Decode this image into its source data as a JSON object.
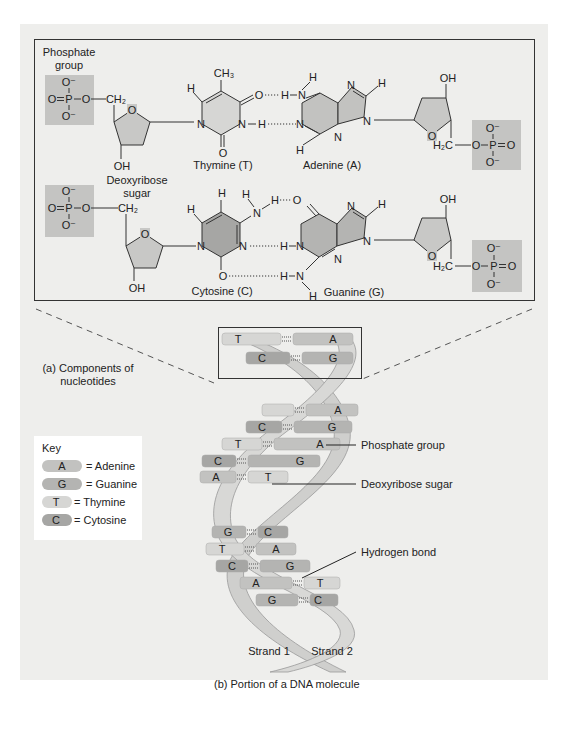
{
  "panel_a": {
    "caption": "(a) Components of nucleotides",
    "caption_line1": "(a) Components of",
    "caption_line2": "nucleotides",
    "labels": {
      "phosphate_group_line1": "Phosphate",
      "phosphate_group_line2": "group",
      "deoxyribose_line1": "Deoxyribose",
      "deoxyribose_line2": "sugar",
      "thymine": "Thymine (T)",
      "adenine": "Adenine (A)",
      "cytosine": "Cytosine (C)",
      "guanine": "Guanine (G)"
    },
    "atoms": {
      "O": "O",
      "O_minus": "O⁻",
      "P": "P",
      "N": "N",
      "H": "H",
      "OH": "OH",
      "CH2": "CH₂",
      "H2C": "H₂C",
      "CH3": "CH₃"
    }
  },
  "panel_b": {
    "caption": "(b) Portion of a DNA molecule",
    "labels": {
      "phosphate_group": "Phosphate group",
      "deoxyribose_sugar": "Deoxyribose sugar",
      "hydrogen_bond": "Hydrogen bond",
      "strand1": "Strand 1",
      "strand2": "Strand 2"
    },
    "base_pairs": [
      {
        "left": "T",
        "right": "A"
      },
      {
        "left": "C",
        "right": "G"
      },
      {
        "left": "",
        "right": "A"
      },
      {
        "left": "C",
        "right": "G"
      },
      {
        "left": "T",
        "right": "A"
      },
      {
        "left": "C",
        "right": "G"
      },
      {
        "left": "A",
        "right": "T"
      },
      {
        "left": "G",
        "right": "C"
      },
      {
        "left": "T",
        "right": "A"
      },
      {
        "left": "C",
        "right": "G"
      },
      {
        "left": "A",
        "right": "T"
      },
      {
        "left": "G",
        "right": "C"
      }
    ]
  },
  "key": {
    "title": "Key",
    "items": [
      {
        "letter": "A",
        "label": "= Adenine"
      },
      {
        "letter": "G",
        "label": "= Guanine"
      },
      {
        "letter": "T",
        "label": "= Thymine"
      },
      {
        "letter": "C",
        "label": "= Cytosine"
      }
    ]
  },
  "colors": {
    "panel_bg": "#eeeeec",
    "phosphate_box": "#c4c4c2",
    "sugar_fill": "#c8c8c6",
    "thymine_fill": "#d6d6d4",
    "adenine_fill": "#c2c2c0",
    "cytosine_fill": "#a6a6a4",
    "guanine_fill": "#b4b4b2",
    "strand_fill": "#cfcfcd"
  }
}
